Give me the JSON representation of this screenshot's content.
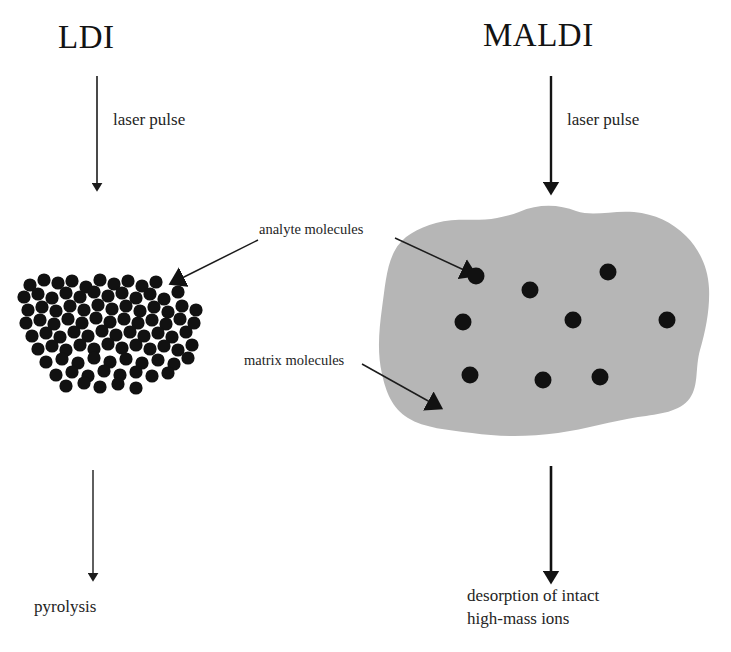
{
  "figure": {
    "background_color": "#ffffff",
    "ink_color": "#1a1a1a",
    "matrix_fill_color": "#b6b6b6",
    "molecule_color": "#111111",
    "width": 731,
    "height": 652
  },
  "panels": {
    "left": {
      "title": "LDI",
      "laser_label": "laser pulse",
      "outcome_label": "pyrolysis",
      "sample_description": "dense cluster of analyte molecules without matrix"
    },
    "right": {
      "title": "MALDI",
      "laser_label": "laser pulse",
      "outcome_label_line1": "desorption of intact",
      "outcome_label_line2": "high-mass ions",
      "sample_description": "analyte molecules dispersed in a matrix crystal"
    }
  },
  "annotations": {
    "analyte": "analyte molecules",
    "matrix": "matrix molecules"
  },
  "chart_data": {
    "type": "diagram",
    "panels": [
      "LDI",
      "MALDI"
    ],
    "left_cluster_dot_count": 78,
    "right_matrix_dot_count": 9,
    "left_dot_radius": 6.6,
    "right_dot_radius": 8.5,
    "left_cluster_dots": [
      [
        30,
        285
      ],
      [
        44,
        280
      ],
      [
        58,
        283
      ],
      [
        72,
        281
      ],
      [
        86,
        287
      ],
      [
        100,
        280
      ],
      [
        114,
        284
      ],
      [
        128,
        281
      ],
      [
        142,
        286
      ],
      [
        156,
        282
      ],
      [
        24,
        297
      ],
      [
        38,
        294
      ],
      [
        52,
        298
      ],
      [
        66,
        293
      ],
      [
        80,
        297
      ],
      [
        94,
        292
      ],
      [
        108,
        296
      ],
      [
        122,
        293
      ],
      [
        136,
        298
      ],
      [
        150,
        294
      ],
      [
        164,
        299
      ],
      [
        178,
        292
      ],
      [
        28,
        310
      ],
      [
        42,
        307
      ],
      [
        56,
        311
      ],
      [
        70,
        306
      ],
      [
        84,
        310
      ],
      [
        98,
        305
      ],
      [
        112,
        309
      ],
      [
        126,
        306
      ],
      [
        140,
        311
      ],
      [
        154,
        307
      ],
      [
        168,
        312
      ],
      [
        182,
        306
      ],
      [
        196,
        310
      ],
      [
        26,
        323
      ],
      [
        40,
        320
      ],
      [
        54,
        324
      ],
      [
        68,
        319
      ],
      [
        82,
        323
      ],
      [
        96,
        318
      ],
      [
        110,
        322
      ],
      [
        124,
        319
      ],
      [
        138,
        323
      ],
      [
        152,
        320
      ],
      [
        166,
        324
      ],
      [
        180,
        319
      ],
      [
        194,
        323
      ],
      [
        32,
        336
      ],
      [
        46,
        333
      ],
      [
        60,
        337
      ],
      [
        74,
        332
      ],
      [
        88,
        336
      ],
      [
        102,
        331
      ],
      [
        116,
        335
      ],
      [
        130,
        332
      ],
      [
        144,
        336
      ],
      [
        158,
        333
      ],
      [
        172,
        337
      ],
      [
        186,
        332
      ],
      [
        38,
        349
      ],
      [
        52,
        346
      ],
      [
        66,
        350
      ],
      [
        80,
        345
      ],
      [
        94,
        349
      ],
      [
        108,
        344
      ],
      [
        122,
        348
      ],
      [
        136,
        345
      ],
      [
        150,
        349
      ],
      [
        164,
        346
      ],
      [
        178,
        350
      ],
      [
        192,
        345
      ],
      [
        46,
        362
      ],
      [
        62,
        359
      ],
      [
        78,
        363
      ],
      [
        94,
        358
      ],
      [
        110,
        362
      ],
      [
        126,
        359
      ],
      [
        142,
        363
      ],
      [
        158,
        360
      ],
      [
        174,
        364
      ],
      [
        188,
        358
      ],
      [
        56,
        375
      ],
      [
        72,
        372
      ],
      [
        88,
        376
      ],
      [
        104,
        371
      ],
      [
        120,
        375
      ],
      [
        136,
        372
      ],
      [
        152,
        376
      ],
      [
        168,
        373
      ],
      [
        66,
        386
      ],
      [
        84,
        383
      ],
      [
        100,
        387
      ],
      [
        118,
        384
      ],
      [
        136,
        388
      ]
    ],
    "right_matrix_dots": [
      [
        476,
        276
      ],
      [
        530,
        290
      ],
      [
        608,
        272
      ],
      [
        463,
        322
      ],
      [
        573,
        320
      ],
      [
        667,
        320
      ],
      [
        470,
        375
      ],
      [
        543,
        380
      ],
      [
        600,
        377
      ]
    ],
    "matrix_blob_outline": "gray amorphous crystal region spanning x 380-710, y 205-438"
  }
}
